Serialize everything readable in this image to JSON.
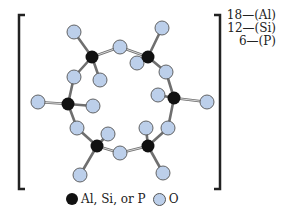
{
  "figure": {
    "labels": [
      {
        "count": "18",
        "element": "(Al)"
      },
      {
        "count": "12",
        "element": "(Si)"
      },
      {
        "count": "6",
        "element": "(P)"
      }
    ],
    "label_lines": [
      "18—(Al)",
      "12—(Si)",
      "6—(P)"
    ],
    "legend": {
      "black_label": "Al, Si, or P",
      "oxygen_label": "O"
    },
    "colors": {
      "tetrahedral_atom": "#111111",
      "oxygen_atom": "#bccfea",
      "bond": "#777777",
      "bracket": "#222222"
    },
    "tetrahedral_atoms": [
      {
        "x": 92,
        "y": 57
      },
      {
        "x": 148,
        "y": 57
      },
      {
        "x": 68,
        "y": 104
      },
      {
        "x": 174,
        "y": 98
      },
      {
        "x": 97,
        "y": 146
      },
      {
        "x": 148,
        "y": 146
      }
    ],
    "oxygen_atoms": [
      {
        "x": 74,
        "y": 32
      },
      {
        "x": 162,
        "y": 28
      },
      {
        "x": 120,
        "y": 47
      },
      {
        "x": 137,
        "y": 63
      },
      {
        "x": 74,
        "y": 77
      },
      {
        "x": 100,
        "y": 80
      },
      {
        "x": 166,
        "y": 72
      },
      {
        "x": 158,
        "y": 95
      },
      {
        "x": 38,
        "y": 102
      },
      {
        "x": 93,
        "y": 106
      },
      {
        "x": 207,
        "y": 102
      },
      {
        "x": 77,
        "y": 128
      },
      {
        "x": 168,
        "y": 128
      },
      {
        "x": 146,
        "y": 128
      },
      {
        "x": 108,
        "y": 134
      },
      {
        "x": 120,
        "y": 153
      },
      {
        "x": 80,
        "y": 175
      },
      {
        "x": 163,
        "y": 173
      }
    ]
  }
}
